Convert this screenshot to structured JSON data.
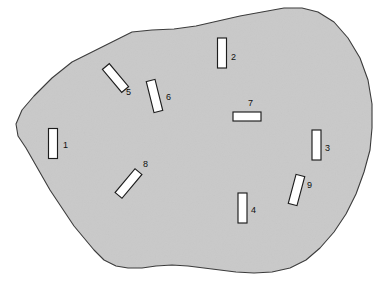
{
  "figure": {
    "type": "scatter-map-diagram",
    "title": "",
    "background_color": "#ffffff",
    "region": {
      "name": "irregular-shaded-region",
      "fill_color": "#c9c9c9",
      "stroke_color": "#3a3a3a",
      "outline_points": "16,124 22,110 34,96 52,78 72,62 92,52 112,42 132,32 152,30 174,29 196,26 218,21 240,16 262,12 284,8 302,8 318,12 334,22 348,38 360,58 368,80 372,104 372,128 370,150 364,172 356,194 346,214 334,232 320,248 306,260 290,268 272,272 254,273 236,272 220,270 204,268 188,266 172,265 156,266 142,268 128,268 116,266 104,260 94,250 84,238 74,226 66,214 58,202 50,190 42,176 34,162 26,148 18,136"
    },
    "markers": [
      {
        "id": "1",
        "label": "1",
        "shape": "rectangle",
        "x": 48.5,
        "y": 128.5,
        "width": 9,
        "height": 30,
        "rotation_deg": 0,
        "label_x": 63,
        "label_y": 146
      },
      {
        "id": "2",
        "label": "2",
        "shape": "rectangle",
        "x": 217.5,
        "y": 38,
        "width": 9,
        "height": 30,
        "rotation_deg": 0,
        "label_x": 231,
        "label_y": 58
      },
      {
        "id": "3",
        "label": "3",
        "shape": "rectangle",
        "x": 312,
        "y": 130,
        "width": 9,
        "height": 30,
        "rotation_deg": 0,
        "label_x": 325,
        "label_y": 149
      },
      {
        "id": "4",
        "label": "4",
        "shape": "rectangle",
        "x": 238,
        "y": 193,
        "width": 9,
        "height": 30,
        "rotation_deg": 0,
        "label_x": 251,
        "label_y": 211
      },
      {
        "id": "5",
        "label": "5",
        "shape": "rectangle",
        "x": 111,
        "y": 63,
        "width": 9,
        "height": 30,
        "rotation_deg": -40,
        "label_x": 126,
        "label_y": 93
      },
      {
        "id": "6",
        "label": "6",
        "shape": "rectangle",
        "x": 150,
        "y": 80,
        "width": 9,
        "height": 32,
        "rotation_deg": -14,
        "label_x": 166,
        "label_y": 98
      },
      {
        "id": "7",
        "label": "7",
        "shape": "rectangle",
        "x": 233,
        "y": 112,
        "width": 28,
        "height": 9,
        "rotation_deg": 0,
        "label_x": 248,
        "label_y": 104
      },
      {
        "id": "8",
        "label": "8",
        "shape": "rectangle",
        "x": 124,
        "y": 168,
        "width": 9,
        "height": 31,
        "rotation_deg": 40,
        "label_x": 143,
        "label_y": 165
      },
      {
        "id": "9",
        "label": "9",
        "shape": "rectangle",
        "x": 292,
        "y": 175,
        "width": 9,
        "height": 30,
        "rotation_deg": 15,
        "label_x": 307,
        "label_y": 186
      }
    ]
  }
}
